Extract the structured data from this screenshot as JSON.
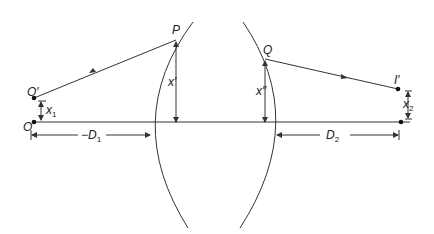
{
  "diagram": {
    "title": "",
    "labels": {
      "P": "P",
      "Q": "Q",
      "O_prime": "O′",
      "O": "O",
      "I_prime": "I′",
      "I": "I",
      "x_prime": "x′",
      "x_double_prime": "x″",
      "x1": "x",
      "x1_sub": "1",
      "x2": "x",
      "x2_sub": "2",
      "D1": "−D",
      "D1_sub": "1",
      "D2": "D",
      "D2_sub": "2"
    },
    "colors": {
      "line": "#333333",
      "background": "#ffffff"
    }
  }
}
